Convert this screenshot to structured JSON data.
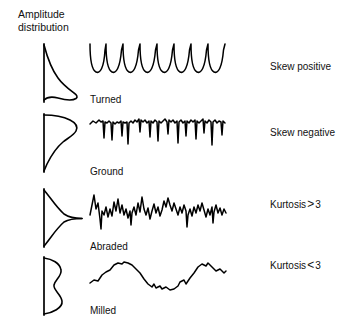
{
  "figure": {
    "heading": "Amplitude\ndistribution",
    "background_color": "#ffffff",
    "ink_color": "#000000"
  },
  "rows": [
    {
      "process_label": "Turned",
      "stat_label_text": "Skew positive",
      "stat_prefix": "Skew positive",
      "stat_symbol": "",
      "stat_value": "",
      "distribution_name": "positive-skew-curve",
      "distribution_description": "Narrow peak near the bottom with a long tail rising upward",
      "profile_name": "turned-profile",
      "profile_description": "Periodic rounded valleys separated by sharp upward peaks"
    },
    {
      "process_label": "Ground",
      "stat_label_text": "Skew negative",
      "stat_prefix": "Skew negative",
      "stat_symbol": "",
      "stat_value": "",
      "distribution_name": "negative-skew-curve",
      "distribution_description": "Broad lobe near the top with a long tail falling downward",
      "profile_name": "ground-profile",
      "profile_description": "High plateau interrupted by deep narrow downward valleys"
    },
    {
      "process_label": "Abraded",
      "stat_label_text": "Kurtosis > 3",
      "stat_prefix": "Kurtosis",
      "stat_symbol": ">",
      "stat_value": "3",
      "distribution_name": "leptokurtic-curve",
      "distribution_description": "Sharp central spike with narrow shoulders",
      "profile_name": "abraded-profile",
      "profile_description": "Dense fine noise punctuated by tall spikes in both directions"
    },
    {
      "process_label": "Milled",
      "stat_label_text": "Kurtosis < 3",
      "stat_prefix": "Kurtosis",
      "stat_symbol": "<",
      "stat_value": "3",
      "distribution_name": "platykurtic-curve",
      "distribution_description": "Flat-topped bimodal shape with two lobes",
      "profile_name": "milled-profile",
      "profile_description": "Smooth long-wavelength undulation with low-frequency waviness"
    }
  ]
}
